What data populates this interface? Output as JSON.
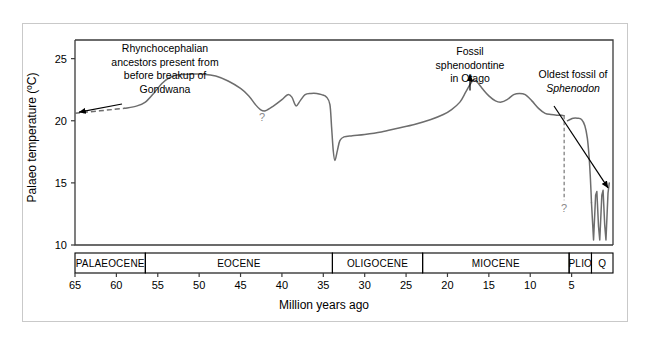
{
  "figure": {
    "title": "",
    "background": "#ffffff",
    "border_color": "#c9c9c9"
  },
  "chart_data": {
    "type": "line",
    "title": "",
    "subtitle": "",
    "xlabel": "Million years ago",
    "ylabel": "Palaeo temperature (ºC)",
    "xlim": [
      65,
      0
    ],
    "ylim": [
      10,
      26.5
    ],
    "x_axis_inverted": true,
    "grid": false,
    "legend": null,
    "xticks": [
      65,
      60,
      55,
      50,
      45,
      40,
      35,
      30,
      25,
      20,
      15,
      10,
      5
    ],
    "xtick_labels": [
      "65",
      "60",
      "55",
      "50",
      "45",
      "40",
      "45",
      "35",
      "30",
      "25",
      "20",
      "15",
      "10",
      "5"
    ],
    "yticks": [
      10,
      15,
      20,
      25
    ],
    "ytick_labels": [
      "10",
      "15",
      "20",
      "25"
    ],
    "series": [
      {
        "name": "Palaeo temperature (inferred, uncertain)",
        "style": "dashed",
        "color": "#6d6d6d",
        "points": [
          [
            65.0,
            20.6
          ],
          [
            63.5,
            20.7
          ],
          [
            62.0,
            20.8
          ],
          [
            60.5,
            20.9
          ],
          [
            59.0,
            21.0
          ]
        ]
      },
      {
        "name": "Palaeo temperature (solid record)",
        "style": "solid",
        "color": "#6d6d6d",
        "points": [
          [
            59.0,
            21.0
          ],
          [
            57.5,
            21.2
          ],
          [
            56.5,
            21.5
          ],
          [
            55.5,
            22.2
          ],
          [
            54.5,
            23.0
          ],
          [
            53.5,
            23.5
          ],
          [
            52.5,
            23.7
          ],
          [
            51.0,
            23.75
          ],
          [
            49.5,
            23.75
          ],
          [
            48.0,
            23.6
          ],
          [
            46.5,
            23.2
          ],
          [
            45.0,
            22.6
          ],
          [
            44.0,
            22.0
          ],
          [
            43.2,
            21.3
          ],
          [
            42.6,
            20.9
          ],
          [
            42.0,
            20.8
          ],
          [
            41.0,
            21.2
          ],
          [
            40.0,
            21.7
          ],
          [
            39.3,
            22.1
          ],
          [
            38.8,
            21.9
          ],
          [
            38.3,
            21.2
          ],
          [
            37.8,
            21.6
          ],
          [
            37.2,
            22.1
          ],
          [
            36.5,
            22.2
          ],
          [
            35.8,
            22.2
          ],
          [
            35.2,
            22.1
          ],
          [
            34.6,
            21.9
          ],
          [
            34.2,
            21.3
          ],
          [
            34.0,
            19.5
          ],
          [
            33.8,
            17.6
          ],
          [
            33.6,
            16.8
          ],
          [
            33.3,
            17.6
          ],
          [
            33.0,
            18.4
          ],
          [
            32.5,
            18.7
          ],
          [
            31.5,
            18.8
          ],
          [
            30.0,
            18.9
          ],
          [
            28.0,
            19.1
          ],
          [
            26.0,
            19.4
          ],
          [
            24.0,
            19.7
          ],
          [
            22.0,
            20.1
          ],
          [
            20.5,
            20.5
          ],
          [
            19.5,
            20.9
          ],
          [
            18.5,
            21.5
          ],
          [
            17.8,
            22.3
          ],
          [
            17.2,
            23.0
          ],
          [
            16.8,
            23.3
          ],
          [
            16.4,
            23.1
          ],
          [
            15.8,
            22.6
          ],
          [
            15.0,
            22.0
          ],
          [
            14.2,
            21.6
          ],
          [
            13.5,
            21.5
          ],
          [
            12.8,
            21.7
          ],
          [
            12.0,
            22.1
          ],
          [
            11.3,
            22.2
          ],
          [
            10.6,
            22.1
          ],
          [
            9.8,
            21.6
          ],
          [
            9.0,
            21.0
          ],
          [
            8.2,
            20.6
          ],
          [
            7.5,
            20.5
          ],
          [
            6.8,
            20.45
          ],
          [
            6.2,
            20.45
          ],
          [
            5.9,
            20.4
          ]
        ]
      },
      {
        "name": "Pliocene onward",
        "style": "solid",
        "color": "#6d6d6d",
        "points": [
          [
            5.5,
            20.0
          ],
          [
            5.2,
            20.1
          ],
          [
            4.8,
            20.2
          ],
          [
            4.3,
            20.2
          ],
          [
            3.8,
            20.1
          ],
          [
            3.4,
            19.6
          ],
          [
            3.1,
            18.6
          ],
          [
            2.9,
            17.2
          ],
          [
            2.75,
            15.6
          ],
          [
            2.65,
            14.2
          ],
          [
            2.6,
            13.4
          ]
        ]
      },
      {
        "name": "Quaternary glacial cycles",
        "style": "solid",
        "color": "#6d6d6d",
        "points": [
          [
            2.6,
            13.4
          ],
          [
            2.45,
            11.6
          ],
          [
            2.35,
            10.4
          ],
          [
            2.1,
            14.0
          ],
          [
            1.95,
            14.3
          ],
          [
            1.75,
            11.5
          ],
          [
            1.6,
            10.4
          ],
          [
            1.35,
            14.0
          ],
          [
            1.2,
            14.4
          ],
          [
            1.0,
            11.6
          ],
          [
            0.85,
            10.4
          ],
          [
            0.6,
            14.2
          ],
          [
            0.45,
            15.0
          ]
        ]
      }
    ],
    "vertical_uncertainty_marker": {
      "x": 5.9,
      "y_top": 20.4,
      "y_bottom": 13.6,
      "label": "?",
      "color": "#8a8a8a"
    },
    "inline_labels": [
      {
        "text": "?",
        "x": 42.4,
        "y": 20.0,
        "color": "#8a8a8a"
      }
    ],
    "annotations": [
      {
        "id": "gondwana",
        "lines": [
          "Rhynchocephalian",
          "ancestors present from",
          "before breakup of",
          "Gondwana"
        ],
        "arrow_points_to": {
          "x": 64.5,
          "y": 20.7
        },
        "arrow_style": "diagonal"
      },
      {
        "id": "otago",
        "lines": [
          "Fossil",
          "sphenodontine",
          "in Otago"
        ],
        "arrow_points_to": {
          "x": 16.8,
          "y": 23.4
        },
        "arrow_style": "vertical"
      },
      {
        "id": "sphenodon",
        "lines": [
          "Oldest fossil of",
          "Sphenodon"
        ],
        "italic_lines": [
          "Sphenodon"
        ],
        "arrow_points_to": {
          "x": 0.6,
          "y": 14.6
        },
        "arrow_style": "diagonal"
      }
    ],
    "epochs": [
      {
        "label": "PALAEOCENE",
        "start": 65.0,
        "end": 56.5
      },
      {
        "label": "EOCENE",
        "start": 56.5,
        "end": 33.9
      },
      {
        "label": "OLIGOCENE",
        "start": 33.9,
        "end": 23.0
      },
      {
        "label": "MIOCENE",
        "start": 23.0,
        "end": 5.3
      },
      {
        "label": "PLIO",
        "start": 5.3,
        "end": 2.6
      },
      {
        "label": "Q",
        "start": 2.6,
        "end": 0.0
      }
    ]
  }
}
